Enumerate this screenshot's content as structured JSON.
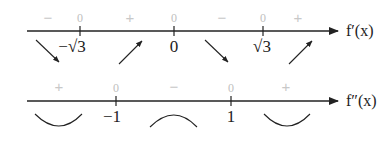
{
  "top_row": {
    "axis_label": "f′(x)",
    "signs": [
      {
        "text": "−",
        "x": 48
      },
      {
        "text": "0",
        "x": 80
      },
      {
        "text": "+",
        "x": 130
      },
      {
        "text": "0",
        "x": 174
      },
      {
        "text": "−",
        "x": 222
      },
      {
        "text": "0",
        "x": 263
      },
      {
        "text": "+",
        "x": 298
      }
    ],
    "ticks": [
      {
        "label": "−√3",
        "x": 80
      },
      {
        "label": "0",
        "x": 174
      },
      {
        "label": "√3",
        "x": 263
      }
    ],
    "arrows": [
      "decreasing",
      "increasing",
      "decreasing",
      "increasing"
    ]
  },
  "bottom_row": {
    "axis_label": "f″(x)",
    "signs": [
      {
        "text": "+",
        "x": 59
      },
      {
        "text": "0",
        "x": 116
      },
      {
        "text": "−",
        "x": 174
      },
      {
        "text": "0",
        "x": 231
      },
      {
        "text": "+",
        "x": 286
      }
    ],
    "ticks": [
      {
        "label": "−1",
        "x": 116
      },
      {
        "label": "1",
        "x": 231
      }
    ],
    "curves": [
      "concave-up",
      "concave-down",
      "concave-up"
    ]
  }
}
